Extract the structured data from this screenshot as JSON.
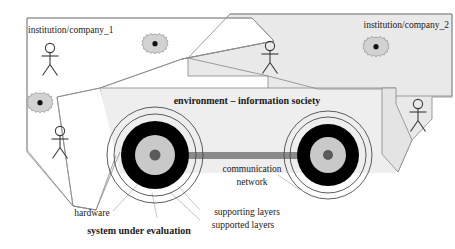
{
  "diagram": {
    "title_visible": false,
    "regions": [
      {
        "id": "institution-company-1",
        "label": "institution/company_1",
        "fill": "#ffffff",
        "stroke": "#8c8c8c"
      },
      {
        "id": "institution-company-2",
        "label": "institution/company_2",
        "fill": "#e8e8e8",
        "stroke": "#8c8c8c"
      },
      {
        "id": "environment",
        "label": "environment – information society",
        "fill": "#eeeeee",
        "stroke": "#8c8c8c"
      }
    ],
    "callouts": [
      {
        "id": "hardware",
        "label": "hardware",
        "bold": false
      },
      {
        "id": "system-under-evaluation",
        "label": "system under evaluation",
        "bold": true
      },
      {
        "id": "supporting-layers",
        "label": "supporting layers",
        "bold": false
      },
      {
        "id": "supported-layers",
        "label": "supported layers",
        "bold": false
      },
      {
        "id": "communication-network-line1",
        "label": "communication",
        "bold": false
      },
      {
        "id": "communication-network-line2",
        "label": "network",
        "bold": false
      }
    ],
    "nodes": {
      "left_target": {
        "name": "system-node-left",
        "rings": [
          "outer-thin",
          "second-thin",
          "black-ring",
          "light-gray-disc",
          "dark-center"
        ]
      },
      "right_target": {
        "name": "system-node-right",
        "rings": [
          "outer-thin",
          "second-thin",
          "black-ring",
          "light-gray-disc",
          "dark-center"
        ]
      },
      "link": {
        "name": "communication-link",
        "color": "#8a8a8a"
      }
    },
    "actors": [
      {
        "id": "actor-company1-top",
        "region": "institution-company-1"
      },
      {
        "id": "actor-company1-bottom",
        "region": "institution-company-1"
      },
      {
        "id": "actor-company1-right",
        "region": "institution-company-1"
      },
      {
        "id": "actor-company2-right",
        "region": "institution-company-2"
      }
    ],
    "gears": [
      {
        "id": "gear-company1-left",
        "region": "institution-company-1"
      },
      {
        "id": "gear-company1-top",
        "region": "institution-company-1"
      },
      {
        "id": "gear-company2",
        "region": "institution-company-2"
      }
    ],
    "colors": {
      "black": "#000000",
      "light_gray_disc": "#c9c9c9",
      "dark_center": "#5a5a5a",
      "link_gray": "#8a8a8a",
      "region_gray": "#e9e9e9",
      "outline_gray": "#8c8c8c",
      "leader_gray": "#b5b5b5",
      "text": "#1a1a1a"
    }
  }
}
